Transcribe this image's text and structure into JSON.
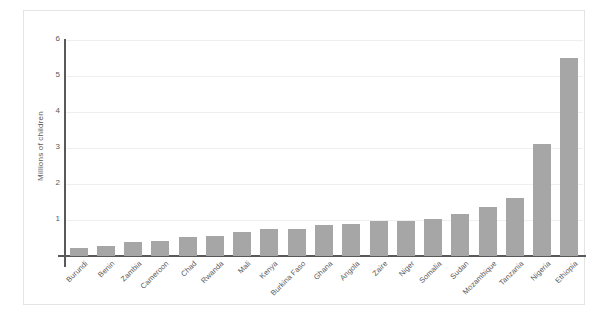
{
  "chart_data": {
    "type": "bar",
    "title": "",
    "subtitle": "",
    "xlabel": "",
    "ylabel": "Millions of children",
    "ylim": [
      0,
      6
    ],
    "ytick_labels": [
      "6",
      "5",
      "4",
      "3",
      "2",
      "1"
    ],
    "ytick_values": [
      6,
      5,
      4,
      3,
      2,
      1
    ],
    "grid": true,
    "legend": "none",
    "bar_color": "#a6a6a6",
    "axis_color": "#595959",
    "gridline_color": "#efefef",
    "categories": [
      "Burundi",
      "Benin",
      "Zambia",
      "Cameroon",
      "Chad",
      "Rwanda",
      "Mali",
      "Kenya",
      "Burkina Faso",
      "Ghana",
      "Angola",
      "Zaire",
      "Niger",
      "Somalia",
      "Sudan",
      "Mozambique",
      "Tanzania",
      "Nigeria",
      "Ethiopia"
    ],
    "values": [
      0.22,
      0.28,
      0.38,
      0.42,
      0.52,
      0.55,
      0.68,
      0.75,
      0.75,
      0.85,
      0.9,
      0.97,
      0.98,
      1.02,
      1.18,
      1.35,
      1.6,
      3.1,
      5.5
    ]
  }
}
